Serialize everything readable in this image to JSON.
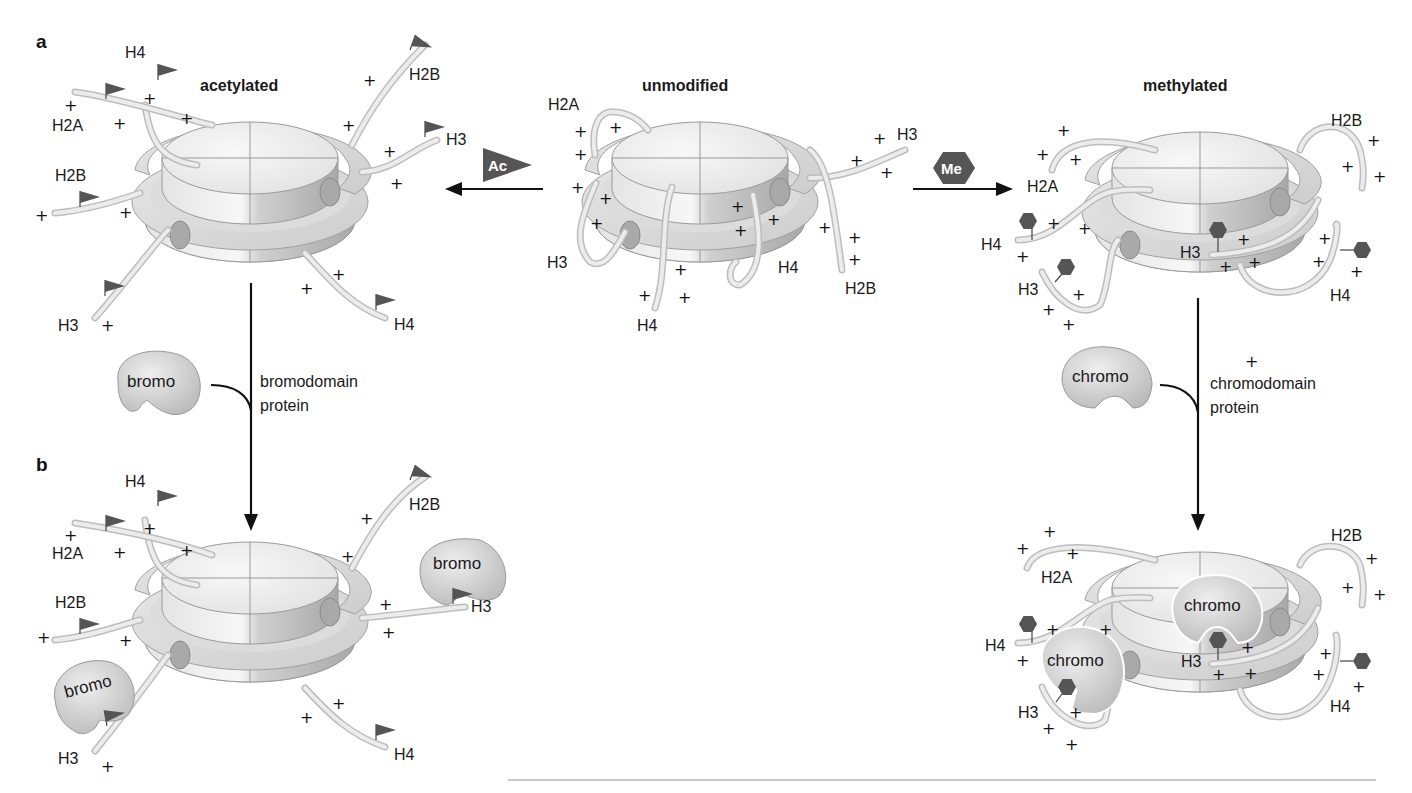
{
  "figure": {
    "panel_labels": {
      "a": "a",
      "b": "b"
    },
    "colors": {
      "background": "#ffffff",
      "histone_light": "#efefef",
      "histone_mid": "#d6d6d6",
      "histone_dark": "#b5b5b5",
      "dna_cylinder": "#a9a9a9",
      "tail": "#e8e8e8",
      "tail_outline": "#bdbdbd",
      "modification_mark": "#555555",
      "protein_fill": "#cfcfcf",
      "text": "#1a1a1a"
    },
    "states": {
      "acetylated": {
        "title": "acetylated"
      },
      "unmodified": {
        "title": "unmodified"
      },
      "methylated": {
        "title": "methylated"
      }
    },
    "reactions": {
      "acetylation": {
        "badge": "Ac",
        "shape": "flag-triangle",
        "direction": "left"
      },
      "methylation": {
        "badge": "Me",
        "shape": "hexagon",
        "direction": "right"
      }
    },
    "binding_steps": {
      "bromo": {
        "protein_label": "bromo",
        "step_line1": "bromodomain",
        "step_line2": "protein"
      },
      "chromo": {
        "protein_label": "chromo",
        "step_line1": "chromodomain",
        "step_line2": "protein"
      }
    },
    "tail_labels": {
      "H2A": "H2A",
      "H2B": "H2B",
      "H3": "H3",
      "H4": "H4"
    },
    "charge_symbol": "+",
    "bound_proteins": {
      "bromo_h3_right": "bromo",
      "bromo_h3_left": "bromo",
      "chromo_h3_center": "chromo",
      "chromo_h3_left": "chromo"
    }
  }
}
